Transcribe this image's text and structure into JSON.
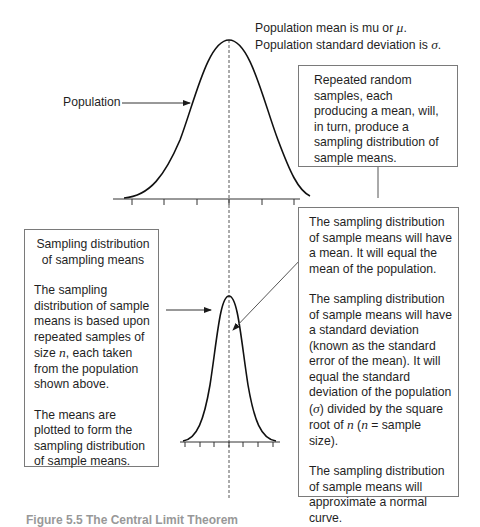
{
  "population_note": {
    "line1_prefix": "Population mean is mu or ",
    "mu_symbol": "μ",
    "line1_suffix": ".",
    "line2_prefix": "Population standard deviation is ",
    "sigma_symbol": "σ",
    "line2_suffix": "."
  },
  "population_label": "Population",
  "repeated_box": {
    "text": "Repeated random samples, each producing a mean, will, in turn, produce a sampling distribution of sample means."
  },
  "left_box": {
    "title": "Sampling distribution of sampling means",
    "para1_a": "The sampling distribution of sample means is based upon repeated samples of size ",
    "para1_n": "n",
    "para1_b": ", each taken from the population shown above.",
    "para2": "The means are plotted to form the sampling distribution of sample means."
  },
  "right_box": {
    "para1": "The sampling distribution of sample means will have a mean. It will equal the mean of the population.",
    "para2_a": "The sampling distribution of sample means will have a standard deviation (known as the standard error of the mean). It will equal the standard deviation of the population (",
    "para2_sigma": "σ",
    "para2_b": ") divided by the square root of ",
    "para2_n1": "n",
    "para2_c": " (",
    "para2_n2": "n",
    "para2_d": " = sample size).",
    "para3": "The sampling distribution of sample means will approximate a normal curve."
  },
  "caption": "Figure 5.5   The Central Limit Theorem",
  "colors": {
    "line": "#1a1a1a",
    "box_border": "#7a7a7a",
    "arrow": "#555555"
  }
}
